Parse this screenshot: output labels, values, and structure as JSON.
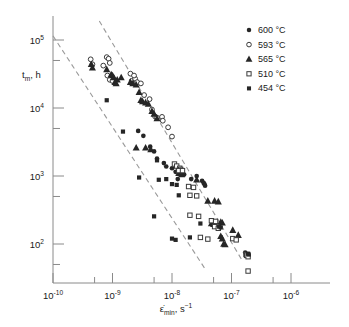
{
  "chart_data": {
    "type": "scatter",
    "title": "",
    "xlabel": "ε̇min, s⁻¹",
    "ylabel": "tm, h",
    "xlabel_base": "ε̇",
    "xlabel_sub": "min",
    "xlabel_unit": "s",
    "xlabel_unit_exp": "−1",
    "ylabel_base": "t",
    "ylabel_sub": "m",
    "ylabel_unit": "h",
    "xscale": "log",
    "yscale": "log",
    "xlim": [
      1e-10,
      1e-06
    ],
    "ylim": [
      40,
      200000
    ],
    "grid": false,
    "legend_position": "top-right",
    "xticks": [
      {
        "value": 1e-10,
        "base": "10",
        "exp": "-10"
      },
      {
        "value": 1e-09,
        "base": "10",
        "exp": "-9"
      },
      {
        "value": 1e-08,
        "base": "10",
        "exp": "-8"
      },
      {
        "value": 1e-07,
        "base": "10",
        "exp": "-7"
      },
      {
        "value": 1e-06,
        "base": "10",
        "exp": "-6"
      }
    ],
    "yticks": [
      {
        "value": 100000,
        "base": "10",
        "exp": "5"
      },
      {
        "value": 10000,
        "base": "10",
        "exp": "4"
      },
      {
        "value": 1000,
        "base": "10",
        "exp": "3"
      },
      {
        "value": 100,
        "base": "10",
        "exp": "2"
      }
    ],
    "series": [
      {
        "name": "600 °C",
        "label": "600 °C",
        "marker": "filled-circle",
        "color": "#262626",
        "points": [
          [
            2.7e-09,
            4600
          ],
          [
            3.3e-09,
            3900
          ],
          [
            4.3e-09,
            2700
          ],
          [
            5e-09,
            2300
          ],
          [
            5.6e-09,
            1800
          ],
          [
            7.3e-09,
            1550
          ],
          [
            8e-09,
            1380
          ],
          [
            1e-08,
            1300
          ],
          [
            1.15e-08,
            1150
          ],
          [
            1.25e-08,
            900
          ],
          [
            1.6e-08,
            1050
          ],
          [
            2.1e-08,
            900
          ],
          [
            2.6e-08,
            1000
          ],
          [
            3.2e-08,
            850
          ],
          [
            3.4e-08,
            790
          ],
          [
            3.5e-08,
            760
          ],
          [
            3.6e-08,
            720
          ],
          [
            1.7e-07,
            75
          ],
          [
            1.85e-07,
            70
          ],
          [
            1.9e-07,
            68
          ]
        ]
      },
      {
        "name": "593 °C",
        "label": "593 °C",
        "marker": "open-circle",
        "color": "#3a3a3a",
        "points": [
          [
            4.3e-10,
            52000
          ],
          [
            4.6e-10,
            44000
          ],
          [
            7e-10,
            42000
          ],
          [
            8e-10,
            56000
          ],
          [
            8.6e-10,
            53000
          ],
          [
            9e-10,
            46000
          ],
          [
            8.2e-10,
            30000
          ],
          [
            9e-10,
            26000
          ],
          [
            1e-09,
            25000
          ],
          [
            2.1e-09,
            25000
          ],
          [
            2.4e-09,
            27000
          ],
          [
            2.6e-09,
            24000
          ],
          [
            3e-09,
            23000
          ],
          [
            3.4e-09,
            15500
          ],
          [
            4.2e-09,
            13500
          ],
          [
            4.6e-09,
            9500
          ],
          [
            5.2e-09,
            7500
          ],
          [
            5.6e-09,
            7200
          ],
          [
            6.8e-09,
            7400
          ],
          [
            7e-09,
            6500
          ],
          [
            8.6e-09,
            5200
          ],
          [
            1e-08,
            3800
          ],
          [
            2e-09,
            32000
          ],
          [
            2.3e-09,
            30000
          ]
        ]
      },
      {
        "name": "565 °C",
        "label": "565 °C",
        "marker": "filled-triangle",
        "color": "#262626",
        "points": [
          [
            4.4e-10,
            44000
          ],
          [
            4.6e-10,
            39000
          ],
          [
            8e-10,
            37000
          ],
          [
            9.5e-10,
            31000
          ],
          [
            1e-09,
            30000
          ],
          [
            1.05e-09,
            28000
          ],
          [
            1.1e-09,
            24000
          ],
          [
            1.15e-09,
            23000
          ],
          [
            1.2e-09,
            26000
          ],
          [
            1.4e-09,
            28000
          ],
          [
            2e-09,
            24000
          ],
          [
            2.2e-09,
            23000
          ],
          [
            2.5e-09,
            22000
          ],
          [
            2.8e-09,
            17000
          ],
          [
            3e-09,
            13000
          ],
          [
            3.2e-09,
            12500
          ],
          [
            3.6e-09,
            12000
          ],
          [
            4e-09,
            11500
          ],
          [
            4.6e-09,
            9000
          ],
          [
            5e-09,
            8200
          ],
          [
            5.6e-09,
            7000
          ],
          [
            2.5e-09,
            2600
          ],
          [
            3.6e-09,
            2600
          ],
          [
            4.4e-09,
            2450
          ],
          [
            1.3e-08,
            1100
          ],
          [
            1.45e-08,
            1050
          ],
          [
            2.6e-08,
            880
          ],
          [
            4e-08,
            430
          ],
          [
            5.2e-08,
            430
          ],
          [
            6e-08,
            420
          ],
          [
            4.6e-08,
            200
          ],
          [
            5e-08,
            195
          ],
          [
            6.6e-08,
            210
          ],
          [
            7e-08,
            205
          ],
          [
            6.6e-08,
            130
          ],
          [
            7e-08,
            120
          ],
          [
            7.4e-08,
            100
          ],
          [
            7.8e-08,
            98
          ],
          [
            1.05e-07,
            160
          ],
          [
            1.3e-07,
            135
          ]
        ]
      },
      {
        "name": "510 °C",
        "label": "510 °C",
        "marker": "open-square",
        "color": "#3a3a3a",
        "points": [
          [
            1.1e-08,
            1500
          ],
          [
            1.2e-08,
            1400
          ],
          [
            1.35e-08,
            1300
          ],
          [
            1.4e-08,
            1250
          ],
          [
            1.3e-08,
            1200
          ],
          [
            1.5e-08,
            1200
          ],
          [
            1.9e-08,
            700
          ],
          [
            2.3e-08,
            680
          ],
          [
            2e-08,
            520
          ],
          [
            2.6e-08,
            510
          ],
          [
            2e-08,
            265
          ],
          [
            2.8e-08,
            255
          ],
          [
            3e-08,
            125
          ],
          [
            4e-08,
            118
          ],
          [
            4.6e-08,
            220
          ],
          [
            5.4e-08,
            215
          ],
          [
            5.2e-08,
            180
          ],
          [
            6e-08,
            170
          ],
          [
            1.05e-07,
            120
          ],
          [
            1.2e-07,
            115
          ],
          [
            1.75e-07,
            70
          ],
          [
            1.8e-07,
            68
          ],
          [
            1.9e-07,
            40
          ],
          [
            1.9e-07,
            65
          ]
        ]
      },
      {
        "name": "454 °C",
        "label": "454 °C",
        "marker": "filled-square",
        "color": "#262626",
        "points": [
          [
            8e-10,
            13000
          ],
          [
            1.5e-09,
            4500
          ],
          [
            2.8e-09,
            950
          ],
          [
            5.6e-09,
            1700
          ],
          [
            6e-09,
            880
          ],
          [
            8e-09,
            900
          ],
          [
            1e-08,
            760
          ],
          [
            1.2e-08,
            740
          ],
          [
            1.3e-08,
            520
          ],
          [
            5e-09,
            255
          ],
          [
            1e-08,
            120
          ],
          [
            1.15e-08,
            115
          ],
          [
            2e-08,
            125
          ],
          [
            3e-08,
            200
          ],
          [
            6.2e-08,
            180
          ],
          [
            6.6e-08,
            175
          ],
          [
            1.9e-07,
            72
          ],
          [
            1.95e-07,
            70
          ]
        ]
      }
    ],
    "trendlines": [
      {
        "name": "upper-bound",
        "style": "dashed",
        "color": "#9a9a9a",
        "x": [
          6e-10,
          1.5e-07
        ],
        "y": [
          190000,
          58
        ]
      },
      {
        "name": "lower-bound",
        "style": "dashed",
        "color": "#9a9a9a",
        "x": [
          1e-10,
          3.6e-08
        ],
        "y": [
          115000,
          43
        ]
      }
    ]
  },
  "legend": {
    "entries": [
      {
        "label": "600 °C",
        "marker": "filled-circle"
      },
      {
        "label": "593 °C",
        "marker": "open-circle"
      },
      {
        "label": "565 °C",
        "marker": "filled-triangle"
      },
      {
        "label": "510 °C",
        "marker": "open-square"
      },
      {
        "label": "454 °C",
        "marker": "filled-square"
      }
    ]
  },
  "colors": {
    "marker_fill": "#262626",
    "marker_stroke": "#3a3a3a",
    "axis": "#8a8a8a",
    "trend": "#9a9a9a",
    "background": "#ffffff"
  }
}
